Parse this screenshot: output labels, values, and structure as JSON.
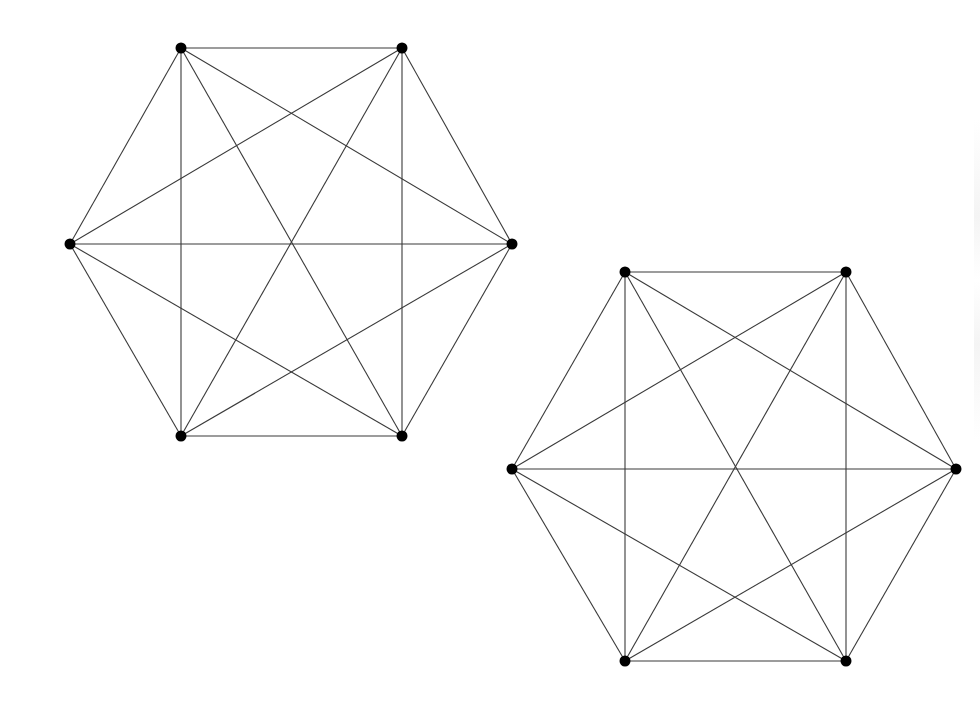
{
  "diagram": {
    "type": "graph",
    "colors": {
      "edge": "#3a3a3a",
      "vertex": "#000000",
      "background": "#ffffff"
    },
    "graphs": [
      {
        "name": "K6-left",
        "vertices": [
          [
            181,
            48
          ],
          [
            402,
            48
          ],
          [
            512,
            244
          ],
          [
            402,
            436
          ],
          [
            181,
            436
          ],
          [
            70,
            244
          ]
        ],
        "edges": "complete"
      },
      {
        "name": "K6-right",
        "vertices": [
          [
            625,
            272
          ],
          [
            846,
            272
          ],
          [
            956,
            469
          ],
          [
            846,
            661
          ],
          [
            625,
            661
          ],
          [
            512,
            469
          ]
        ],
        "edges": "complete"
      }
    ]
  }
}
